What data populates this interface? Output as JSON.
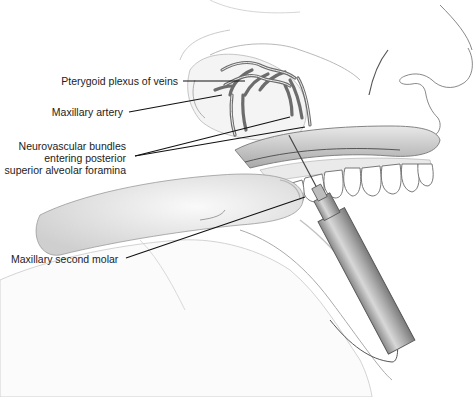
{
  "figure": {
    "type": "anatomical-illustration",
    "colors": {
      "background": "#ffffff",
      "ink": "#222222",
      "shading": "#9a9a9a",
      "vessels": "#6e6e6e"
    }
  },
  "labels": [
    {
      "id": "pterygoid",
      "text": "Pterygoid plexus of veins"
    },
    {
      "id": "maxillary_artery",
      "text": "Maxillary artery"
    },
    {
      "id": "neurovascular_l1",
      "text": "Neurovascular bundles"
    },
    {
      "id": "neurovascular_l2",
      "text": "entering posterior"
    },
    {
      "id": "neurovascular_l3",
      "text": "superior alveolar foramina"
    },
    {
      "id": "molar",
      "text": "Maxillary second molar"
    }
  ],
  "leader_lines": [
    {
      "from": [
        183,
        81
      ],
      "to": [
        245,
        81
      ]
    },
    {
      "from": [
        129,
        112
      ],
      "to": [
        222,
        95
      ]
    },
    {
      "from": [
        135,
        156
      ],
      "to": [
        290,
        117
      ]
    },
    {
      "from": [
        135,
        156
      ],
      "to": [
        305,
        127
      ]
    },
    {
      "from": [
        126,
        258
      ],
      "to": [
        305,
        197
      ]
    }
  ]
}
